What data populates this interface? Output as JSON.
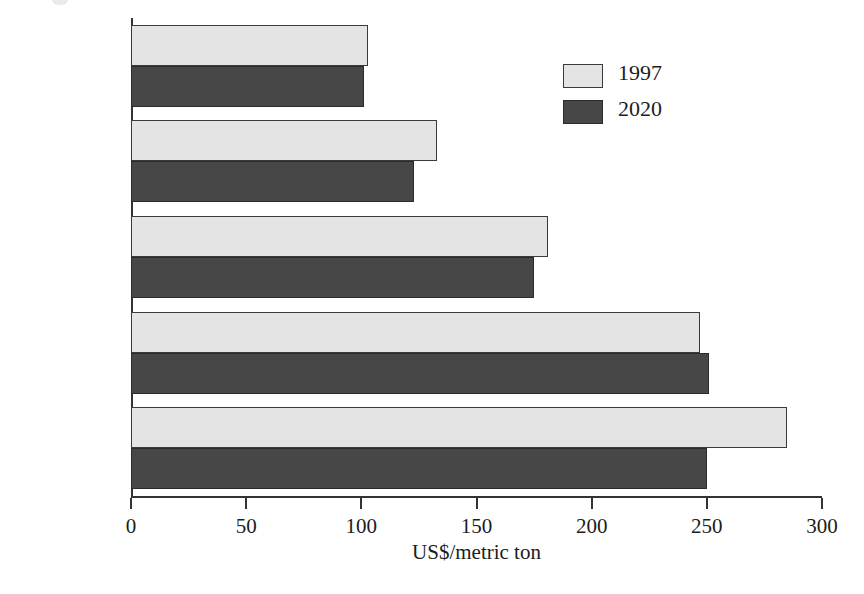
{
  "chart_data": {
    "type": "bar",
    "orientation": "horizontal",
    "title": "",
    "xlabel": "US$/metric ton",
    "ylabel": "",
    "xlim": [
      0,
      300
    ],
    "xticks": [
      0,
      50,
      100,
      150,
      200,
      250,
      300
    ],
    "xtick_labels": [
      "0",
      "50",
      "100",
      "150",
      "200",
      "250",
      "300"
    ],
    "grid": false,
    "legend_position": "upper right",
    "categories": [
      "Maize",
      "Wheat",
      "Beef",
      "Soy beans",
      "Rice"
    ],
    "series": [
      {
        "name": "1997",
        "color": "#e4e4e4",
        "values": [
          103,
          133,
          181,
          247,
          285
        ]
      },
      {
        "name": "2020",
        "color": "#474747",
        "values": [
          101,
          123,
          175,
          251,
          250
        ]
      }
    ]
  },
  "legend": {
    "entries": [
      {
        "label": "1997",
        "swatch": "light"
      },
      {
        "label": "2020",
        "swatch": "dark"
      }
    ]
  },
  "axis": {
    "x_title": "US$/metric ton"
  }
}
